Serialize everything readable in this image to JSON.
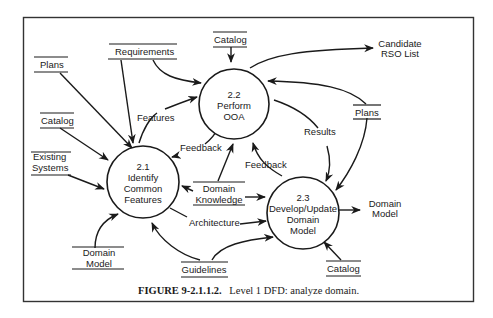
{
  "figure": {
    "caption_number": "FIGURE 9-2.1.1.2.",
    "caption_text": "Level 1 DFD: analyze domain."
  },
  "processes": [
    {
      "id": "2.1",
      "lines": [
        "2.1",
        "Identify",
        "Common",
        "Features"
      ]
    },
    {
      "id": "2.2",
      "lines": [
        "2.2",
        "Perform",
        "OOA"
      ]
    },
    {
      "id": "2.3",
      "lines": [
        "2.3",
        "Develop/Update",
        "Domain",
        "Model"
      ]
    }
  ],
  "stores": {
    "plans_left": [
      "Plans"
    ],
    "requirements": [
      "Requirements"
    ],
    "catalog_top": [
      "Catalog"
    ],
    "catalog_left": [
      "Catalog"
    ],
    "existing_systems": [
      "Existing",
      "Systems"
    ],
    "domain_model_store": [
      "Domain",
      "Model"
    ],
    "domain_knowledge": [
      "Domain",
      "Knowledge"
    ],
    "guidelines": [
      "Guidelines"
    ],
    "plans_right": [
      "Plans"
    ],
    "catalog_bottom": [
      "Catalog"
    ]
  },
  "terminals": {
    "candidate_rso": [
      "Candidate",
      "RSO List"
    ],
    "domain_model_out": [
      "Domain",
      "Model"
    ]
  },
  "flows": {
    "features": "Features",
    "feedback_1": "Feedback",
    "feedback_2": "Feedback",
    "results": "Results",
    "architecture": "Architecture"
  },
  "colors": {
    "ink": "#1a1a1a",
    "frame": "#333333",
    "background": "#ffffff"
  }
}
